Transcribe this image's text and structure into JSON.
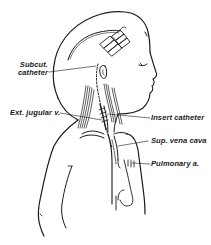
{
  "figure": {
    "type": "medical-line-illustration",
    "colors": {
      "ink": "#1a1a1a",
      "background": "#ffffff"
    }
  },
  "labels": {
    "subcut_catheter": {
      "line1": "Subcut.",
      "line2": "catheter"
    },
    "ext_jugular": "Ext. jugular v.",
    "insert_catheter": "Insert catheter",
    "sup_vena_cava": "Sup. vena cava",
    "pulmonary_a": "Pulmonary a."
  }
}
